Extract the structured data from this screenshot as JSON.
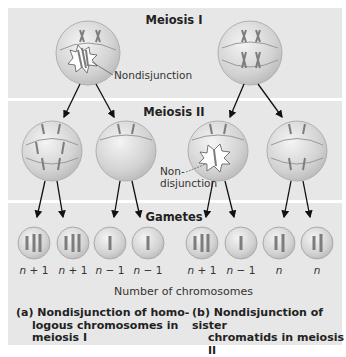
{
  "sections": {
    "meiosis1": {
      "title": "Meiosis I"
    },
    "meiosis2": {
      "title": "Meiosis II"
    },
    "gametes": {
      "title": "Gametes"
    }
  },
  "labels": {
    "nondisjunction_1": "Nondisjunction",
    "nondisjunction_2_line1": "Non-",
    "nondisjunction_2_line2": "disjunction"
  },
  "gametes": [
    {
      "n": "n",
      "suffix": " + 1"
    },
    {
      "n": "n",
      "suffix": " + 1"
    },
    {
      "n": "n",
      "suffix": " − 1"
    },
    {
      "n": "n",
      "suffix": " − 1"
    },
    {
      "n": "n",
      "suffix": " + 1"
    },
    {
      "n": "n",
      "suffix": " − 1"
    },
    {
      "n": "n",
      "suffix": ""
    },
    {
      "n": "n",
      "suffix": ""
    }
  ],
  "axis_label": "Number of chromosomes",
  "captions": {
    "a_line1": "(a) Nondisjunction of homo-",
    "a_line2": "logous chromosomes in",
    "a_line3": "meiosis I",
    "b_line1": "(b) Nondisjunction of sister",
    "b_line2": "chromatids in meiosis II"
  },
  "colors": {
    "panel_bg": "#e7e7e7",
    "cell_fill": "#d4d4d4",
    "chromosome": "#7d7d7d",
    "arrow": "#111111"
  }
}
